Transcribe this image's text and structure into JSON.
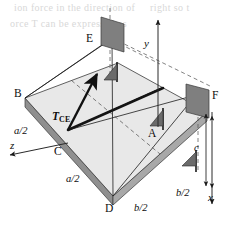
{
  "figure": {
    "type": "engineering-statics-free-body-diagram",
    "background_color": "#ffffff",
    "plate_top_color": "#e6e6e6",
    "plate_edge_color": "#b3b3b3",
    "plate_side_color": "#999999",
    "support_color": "#6e6e6e",
    "anchor_plate_color": "#8a8a8a",
    "line_color": "#1a1a1a"
  },
  "points": {
    "A": "A",
    "B": "B",
    "C": "C",
    "D": "D",
    "E": "E",
    "F": "F"
  },
  "force": {
    "symbol": "T",
    "subscript": "CE"
  },
  "axes": {
    "x": "x",
    "y": "y",
    "z": "z"
  },
  "dimensions": {
    "a_half_left": "a/2",
    "a_half_front": "a/2",
    "b_half_left": "b/2",
    "b_half_right": "b/2",
    "c": "c"
  },
  "bleed_text": {
    "line1": "ion force in the direction of",
    "line2": "orce T can be expressed as",
    "line3": "right so t"
  }
}
